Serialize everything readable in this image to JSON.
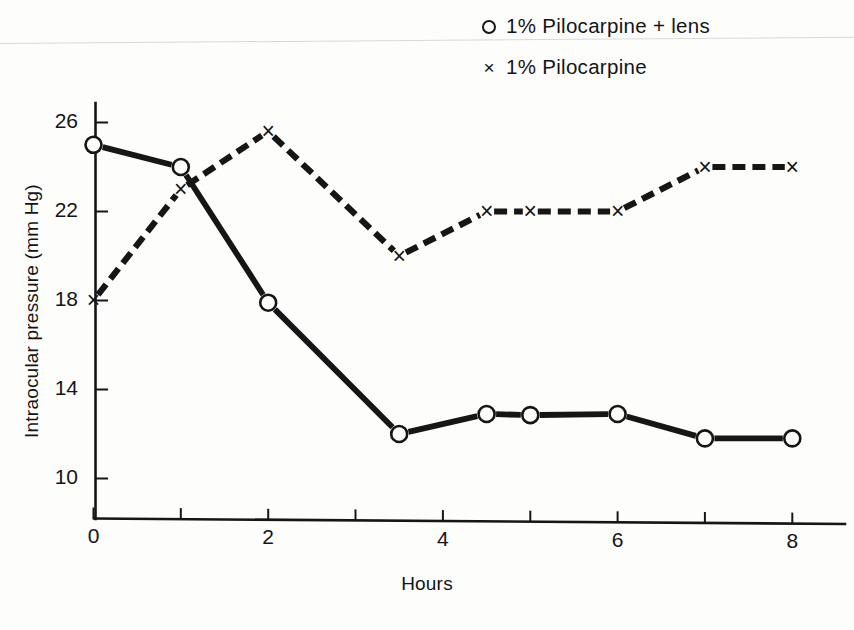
{
  "figure": {
    "background_color": "#fdfdfc",
    "ink_color": "#161616"
  },
  "legend": {
    "position": "top-center-right",
    "entries": [
      {
        "marker": "open-circle",
        "label": "1%  Pilocarpine + lens"
      },
      {
        "marker": "cross-x",
        "label": "1%  Pilocarpine"
      }
    ]
  },
  "axes": {
    "xlabel": "Hours",
    "ylabel": "Intraocular pressure (mm Hg)",
    "x_major_ticks": [
      "0",
      "2",
      "4",
      "6",
      "8"
    ],
    "y_major_ticks": [
      "10",
      "14",
      "18",
      "22",
      "26"
    ]
  },
  "chart_data": {
    "type": "line",
    "title": "",
    "xlabel": "Hours",
    "ylabel": "Intraocular pressure (mm Hg)",
    "xlim": [
      0,
      8.55
    ],
    "ylim": [
      8.6,
      27.2
    ],
    "xticks": [
      0,
      1,
      2,
      3,
      4,
      5,
      6,
      7,
      8
    ],
    "xticklabels": [
      "0",
      "",
      "2",
      "",
      "4",
      "",
      "6",
      "",
      "8"
    ],
    "yticks": [
      10,
      14,
      18,
      22,
      26
    ],
    "yticklabels": [
      "10",
      "14",
      "18",
      "22",
      "26"
    ],
    "grid": false,
    "legend_position": "upper center",
    "series": [
      {
        "name": "1%  Pilocarpine + lens",
        "marker": "open-circle",
        "linestyle": "solid",
        "x": [
          0,
          1,
          2,
          3.5,
          4.5,
          5,
          6,
          7,
          8
        ],
        "y": [
          25,
          24,
          17.9,
          12,
          12.9,
          12.85,
          12.9,
          11.8,
          11.8
        ]
      },
      {
        "name": "1%  Pilocarpine",
        "marker": "cross-x",
        "linestyle": "dashed",
        "x": [
          0,
          1,
          2,
          3.5,
          4.5,
          5,
          6,
          7,
          8
        ],
        "y": [
          18,
          23,
          25.6,
          20,
          22,
          22,
          22,
          24,
          24
        ]
      }
    ]
  }
}
